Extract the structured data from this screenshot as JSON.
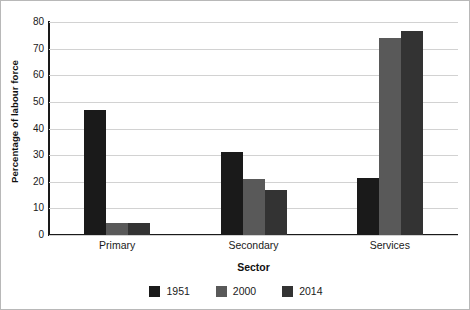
{
  "chart_data": {
    "type": "bar",
    "title": "",
    "xlabel": "Sector",
    "ylabel": "Percentage of labour force",
    "categories": [
      "Primary",
      "Secondary",
      "Services"
    ],
    "series": [
      {
        "name": "1951",
        "color": "#1a1a1a",
        "values": [
          47,
          31,
          21.5
        ]
      },
      {
        "name": "2000",
        "color": "#595959",
        "values": [
          4.5,
          21,
          74
        ]
      },
      {
        "name": "2014",
        "color": "#333333",
        "values": [
          4.5,
          17,
          76.5
        ]
      }
    ],
    "ylim": [
      0,
      80
    ],
    "yticks": [
      0,
      10,
      20,
      30,
      40,
      50,
      60,
      70,
      80
    ],
    "ytick_labels": [
      "0",
      "10",
      "20",
      "30",
      "40",
      "50",
      "60",
      "70",
      "80"
    ],
    "grid": true,
    "legend_position": "bottom",
    "gridline_color": "#d2d2d2",
    "axis_color": "#1a1a1a",
    "background_color": "#ffffff"
  }
}
